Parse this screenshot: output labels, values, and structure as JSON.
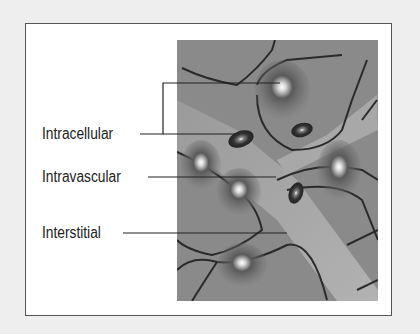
{
  "diagram": {
    "labels": [
      {
        "id": "intracellular",
        "text": "Intracellular"
      },
      {
        "id": "intravascular",
        "text": "Intravascular"
      },
      {
        "id": "interstitial",
        "text": "Interstitial"
      }
    ],
    "colors": {
      "background": "#eeeeee",
      "frame": "#555555",
      "panel": "#ffffff",
      "leader": "#222222"
    }
  }
}
